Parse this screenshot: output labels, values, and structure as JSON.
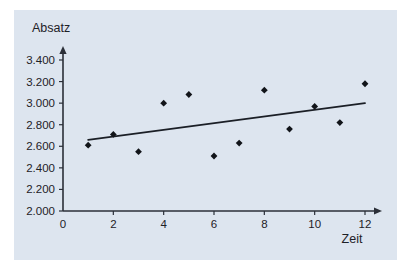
{
  "figure": {
    "background_color": "#ffffff",
    "panel_color": "#dde5ef"
  },
  "chart_data": {
    "type": "scatter",
    "title": "",
    "xlabel": "Zeit",
    "ylabel": "Absatz",
    "xlim": [
      0,
      12.6
    ],
    "ylim": [
      2000,
      3450
    ],
    "grid": false,
    "legend": "none",
    "x": [
      1,
      2,
      3,
      4,
      5,
      6,
      7,
      8,
      9,
      10,
      11,
      12
    ],
    "values": [
      2610,
      2710,
      2550,
      3000,
      3080,
      2510,
      2630,
      3120,
      2760,
      2970,
      2820,
      3180
    ],
    "series": [
      {
        "name": "Absatz",
        "type": "scatter",
        "marker": "diamond",
        "color": "#111419",
        "x": [
          1,
          2,
          3,
          4,
          5,
          6,
          7,
          8,
          9,
          10,
          11,
          12
        ],
        "values": [
          2610,
          2710,
          2550,
          3000,
          3080,
          2510,
          2630,
          3120,
          2760,
          2970,
          2820,
          3180
        ]
      },
      {
        "name": "Trendlinie",
        "type": "line",
        "color": "#1b1f26",
        "x": [
          1,
          12
        ],
        "values": [
          2660,
          3000
        ]
      }
    ],
    "xticks": [
      0,
      2,
      4,
      6,
      8,
      10,
      12
    ],
    "xticklabels": [
      "0",
      "2",
      "4",
      "6",
      "8",
      "10",
      "12"
    ],
    "yticks": [
      2000,
      2200,
      2400,
      2600,
      2800,
      3000,
      3200,
      3400
    ],
    "yticklabels": [
      "2.000",
      "2.200",
      "2.400",
      "2.600",
      "2.800",
      "3.000",
      "3.200",
      "3.400"
    ]
  }
}
